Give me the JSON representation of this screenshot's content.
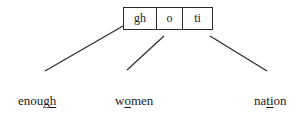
{
  "diagram": {
    "grapheme_box": {
      "cells": [
        {
          "label": "gh"
        },
        {
          "label": "o"
        },
        {
          "label": "ti"
        }
      ]
    },
    "words": [
      {
        "pre": "enou",
        "underlined": "gh",
        "post": "",
        "full": "enough"
      },
      {
        "pre": "w",
        "underlined": "o",
        "post": "men",
        "full": "women"
      },
      {
        "pre": "na",
        "underlined": "ti",
        "post": "on",
        "full": "nation"
      }
    ],
    "connectors": [
      {
        "from": "gh",
        "to": "enough"
      },
      {
        "from": "o",
        "to": "women"
      },
      {
        "from": "ti",
        "to": "nation"
      }
    ],
    "colors": {
      "stroke": "#2a2a2a",
      "text": "#1a1a1a",
      "background": "#ffffff"
    }
  }
}
